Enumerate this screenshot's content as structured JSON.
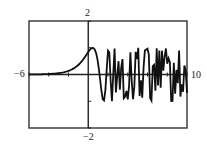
{
  "chart_data": {
    "type": "line",
    "title": "",
    "function": "sin(e^x)",
    "xlabel": "",
    "ylabel": "",
    "xlim": [
      -6,
      10
    ],
    "ylim": [
      -2,
      2
    ],
    "x_tick_step": 2,
    "y_tick_step": 1,
    "grid": false,
    "legend": null,
    "tick_labels": {
      "xmin": "−6",
      "xmax": "10",
      "ymin": "−2",
      "ymax": "2"
    },
    "series": [
      {
        "name": "sin(e^x)",
        "sample_points": 120,
        "key_points": [
          {
            "x": -6,
            "y": 0.0
          },
          {
            "x": -2,
            "y": 0.13
          },
          {
            "x": 0,
            "y": 0.84
          },
          {
            "x": 0.45,
            "y": 1.0
          },
          {
            "x": 1.5,
            "y": -0.98
          },
          {
            "x": 10,
            "y": "oscillating between -1 and 1"
          }
        ]
      }
    ],
    "colors": {
      "curve": "#111111",
      "axes": "#222222",
      "frame": "#333333",
      "background": "#ffffff"
    }
  },
  "frame": {
    "left": 29,
    "top": 21,
    "right": 187,
    "bottom": 128
  }
}
